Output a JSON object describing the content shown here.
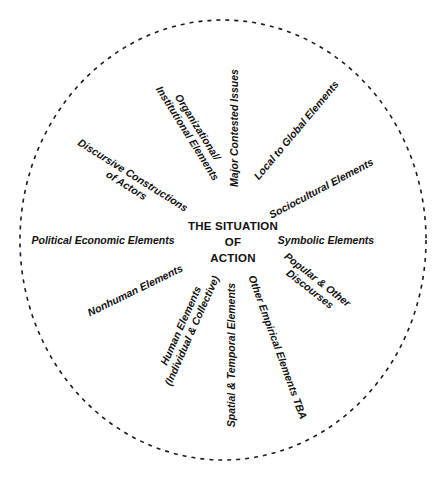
{
  "diagram": {
    "type": "situational-map",
    "center": {
      "lines": [
        "THE SITUATION",
        "OF",
        "ACTION"
      ]
    },
    "boundary": {
      "style": "dashed-ellipse",
      "color": "#1a1a1a"
    },
    "elements": [
      {
        "id": "major-contested-issues",
        "lines": [
          "Major Contested Issues"
        ]
      },
      {
        "id": "organizational-institutional",
        "lines": [
          "Organizational/",
          "Institutional Elements"
        ]
      },
      {
        "id": "discursive-constructions",
        "lines": [
          "Discursive Constructions",
          "of Actors"
        ]
      },
      {
        "id": "political-economic",
        "lines": [
          "Political Economic Elements"
        ]
      },
      {
        "id": "nonhuman",
        "lines": [
          "Nonhuman Elements"
        ]
      },
      {
        "id": "human",
        "lines": [
          "Human Elements",
          "(Individual & Collective)"
        ]
      },
      {
        "id": "spatial-temporal",
        "lines": [
          "Spatial & Temporal Elements"
        ]
      },
      {
        "id": "other-empirical",
        "lines": [
          "Other Empirical Elements TBA"
        ]
      },
      {
        "id": "popular-discourses",
        "lines": [
          "Popular & Other",
          "Discourses"
        ]
      },
      {
        "id": "symbolic",
        "lines": [
          "Symbolic Elements"
        ]
      },
      {
        "id": "sociocultural",
        "lines": [
          "Sociocultural Elements"
        ]
      },
      {
        "id": "local-to-global",
        "lines": [
          "Local to Global Elements"
        ]
      }
    ]
  }
}
